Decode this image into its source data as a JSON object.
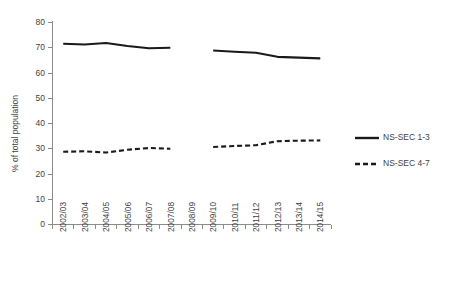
{
  "chart_data": {
    "type": "line",
    "title": "",
    "xlabel": "",
    "ylabel": "% of total population",
    "ylim": [
      0,
      80
    ],
    "yticks": [
      0,
      10,
      20,
      30,
      40,
      50,
      60,
      70,
      80
    ],
    "grid": false,
    "legend_position": "right",
    "categories": [
      "2002/03",
      "2003/04",
      "2004/05",
      "2005/06",
      "2006/07",
      "2007/08",
      "2008/09",
      "2009/10",
      "2010/11",
      "2011/12",
      "2012/13",
      "2013/14",
      "2014/15"
    ],
    "series": [
      {
        "name": "NS-SEC 1-3",
        "style": "solid",
        "values": [
          71.4,
          71.1,
          71.7,
          70.5,
          69.6,
          69.8,
          null,
          68.7,
          68.2,
          67.8,
          66.2,
          65.9,
          65.6
        ]
      },
      {
        "name": "NS-SEC 4-7",
        "style": "dashed",
        "values": [
          28.6,
          28.8,
          28.3,
          29.4,
          30.1,
          29.8,
          null,
          30.5,
          30.9,
          31.2,
          32.8,
          33.0,
          33.1
        ]
      }
    ]
  },
  "legend": {
    "items": [
      {
        "label": "NS-SEC 1-3",
        "style": "solid",
        "color": "#1a1a1a"
      },
      {
        "label": "NS-SEC 4-7",
        "style": "dashed",
        "color": "#1a1a1a"
      }
    ]
  },
  "colors": {
    "series": "#1a1a1a",
    "axis": "#8c8c8c",
    "text": "#3f3f3f",
    "background": "#ffffff"
  }
}
